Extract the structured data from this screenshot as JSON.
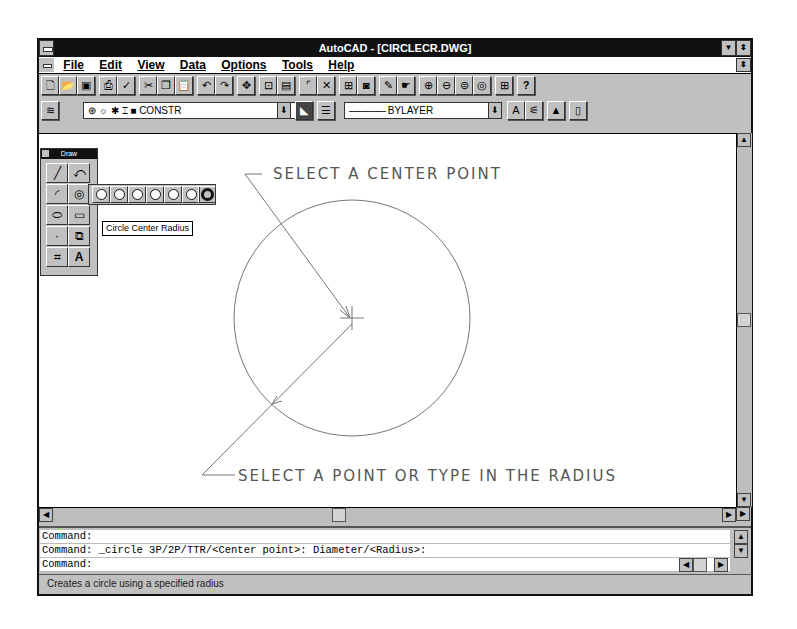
{
  "window": {
    "title": "AutoCAD - [CIRCLECR.DWG]",
    "minimize_icon": "down-arrow",
    "restore_icon": "up-down-arrow"
  },
  "menubar": {
    "items": [
      {
        "label": "File"
      },
      {
        "label": "Edit"
      },
      {
        "label": "View"
      },
      {
        "label": "Data"
      },
      {
        "label": "Options"
      },
      {
        "label": "Tools"
      },
      {
        "label": "Help"
      }
    ]
  },
  "standard_toolbar": {
    "buttons": [
      "new",
      "open",
      "save",
      "print",
      "spell",
      "cut",
      "copy",
      "paste",
      "undo",
      "redo",
      "pan",
      "zoom-window",
      "aerial-view",
      "distance",
      "object-snap",
      "named-views",
      "redraw",
      "help-pan",
      "zoom-in",
      "zoom-out",
      "zoom-all",
      "zoom-extents",
      "tiled-viewports",
      "help"
    ]
  },
  "object_toolbar": {
    "layer_icons": [
      "⊕",
      "☼",
      "✱",
      "⌶",
      "■"
    ],
    "layer_value": "CONSTR",
    "linetype_value": "BYLAYER"
  },
  "draw_toolbar": {
    "title": "Draw",
    "flyout_count": 8,
    "tooltip": "Circle Center Radius"
  },
  "canvas": {
    "annotation_top": "SELECT A CENTER POINT",
    "annotation_bottom": "SELECT A POINT OR TYPE IN THE RADIUS",
    "circle": {
      "cx": 350,
      "cy": 315,
      "r": 118
    }
  },
  "command": {
    "lines": [
      "Command:",
      "Command: _circle 3P/2P/TTR/<Center point>: Diameter/<Radius>:",
      "Command:"
    ]
  },
  "status": {
    "text": "Creates a circle using a specified radius"
  }
}
